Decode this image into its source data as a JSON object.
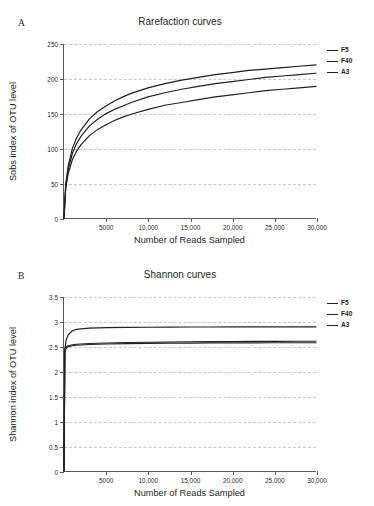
{
  "figure": {
    "background": "#ffffff",
    "line_color": "#231f20",
    "grid_color": "#c9c9c9",
    "axis_color": "#58595b"
  },
  "panels": [
    {
      "letter": "A",
      "title": "Rarefaction curves",
      "legend": [
        "F5",
        "F40",
        "A3"
      ]
    },
    {
      "letter": "B",
      "title": "Shannon curves",
      "legend": [
        "F5",
        "F40",
        "A3"
      ]
    }
  ],
  "chart_data": [
    {
      "type": "line",
      "title": "Rarefaction curves",
      "panel": "A",
      "xlabel": "Number of Reads Sampled",
      "ylabel": "Sobs index of OTU level",
      "xlim": [
        0,
        30000
      ],
      "ylim": [
        0,
        250
      ],
      "xticks": [
        5000,
        10000,
        15000,
        20000,
        25000,
        30000
      ],
      "xticklabels": [
        "5000",
        "10,000",
        "15,000",
        "20,000",
        "25,000",
        "30,000"
      ],
      "yticks": [
        0,
        50,
        100,
        150,
        200,
        250
      ],
      "yticklabels": [
        "0",
        "50",
        "100",
        "150",
        "200",
        "250"
      ],
      "grid": true,
      "legend_position": "right",
      "x": [
        0,
        200,
        500,
        1000,
        1500,
        2000,
        3000,
        4000,
        5000,
        6000,
        7000,
        8000,
        10000,
        12000,
        14000,
        16000,
        18000,
        20000,
        22000,
        24000,
        26000,
        28000,
        30000
      ],
      "series": [
        {
          "name": "F5",
          "values": [
            0,
            48,
            75,
            100,
            115,
            126,
            142,
            153,
            161,
            168,
            174,
            179,
            187,
            193,
            198,
            202,
            206,
            209,
            212,
            214,
            216,
            218,
            220
          ]
        },
        {
          "name": "F40",
          "values": [
            0,
            45,
            70,
            93,
            107,
            117,
            132,
            142,
            150,
            156,
            161,
            166,
            174,
            180,
            185,
            189,
            193,
            196,
            199,
            202,
            204,
            206,
            208
          ]
        },
        {
          "name": "A3",
          "values": [
            0,
            42,
            64,
            84,
            96,
            105,
            118,
            127,
            134,
            140,
            145,
            149,
            156,
            162,
            166,
            170,
            174,
            177,
            180,
            183,
            185,
            187,
            189
          ]
        }
      ]
    },
    {
      "type": "line",
      "title": "Shannon curves",
      "panel": "B",
      "xlabel": "Number of Reads Sampled",
      "ylabel": "Shannon index of OTU level",
      "xlim": [
        0,
        30000
      ],
      "ylim": [
        0,
        3.5
      ],
      "xticks": [
        5000,
        10000,
        15000,
        20000,
        25000,
        30000
      ],
      "xticklabels": [
        "5000",
        "10,000",
        "15,000",
        "20,000",
        "25,000",
        "30,000"
      ],
      "yticks": [
        0,
        0.5,
        1,
        1.5,
        2,
        2.5,
        3,
        3.5
      ],
      "yticklabels": [
        "0",
        "0.5",
        "1",
        "1.5",
        "2",
        "2.5",
        "3",
        "3.5"
      ],
      "grid": true,
      "legend_position": "right",
      "x": [
        0,
        100,
        250,
        500,
        1000,
        1500,
        2000,
        3000,
        4000,
        5000,
        7500,
        10000,
        12500,
        15000,
        17500,
        20000,
        22500,
        25000,
        27500,
        30000
      ],
      "series": [
        {
          "name": "F5",
          "values": [
            0,
            2.44,
            2.63,
            2.74,
            2.82,
            2.85,
            2.86,
            2.875,
            2.88,
            2.885,
            2.89,
            2.892,
            2.894,
            2.896,
            2.897,
            2.898,
            2.899,
            2.9,
            2.9,
            2.9
          ]
        },
        {
          "name": "F40",
          "values": [
            0,
            2.45,
            2.5,
            2.52,
            2.54,
            2.55,
            2.555,
            2.565,
            2.57,
            2.575,
            2.585,
            2.59,
            2.595,
            2.6,
            2.603,
            2.605,
            2.607,
            2.609,
            2.61,
            2.61
          ]
        },
        {
          "name": "A3",
          "values": [
            0,
            2.4,
            2.47,
            2.5,
            2.52,
            2.53,
            2.535,
            2.545,
            2.55,
            2.555,
            2.562,
            2.567,
            2.571,
            2.574,
            2.576,
            2.578,
            2.579,
            2.58,
            2.58,
            2.58
          ]
        }
      ]
    }
  ]
}
